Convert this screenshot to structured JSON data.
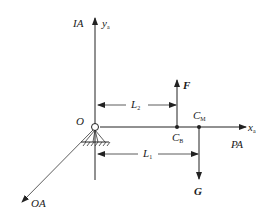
{
  "diagram": {
    "colors": {
      "line": "#222222",
      "background": "#ffffff"
    },
    "labels": {
      "ia": "IA",
      "ya_main": "y",
      "ya_sub": "a",
      "xa_main": "x",
      "xa_sub": "a",
      "pa": "PA",
      "oa": "OA",
      "origin": "O",
      "force_f": "F",
      "force_g": "G",
      "l2_main": "L",
      "l2_sub": "2",
      "l1_main": "L",
      "l1_sub": "1",
      "cb_main": "C",
      "cb_sub": "B",
      "cm_main": "C",
      "cm_sub": "M"
    }
  }
}
